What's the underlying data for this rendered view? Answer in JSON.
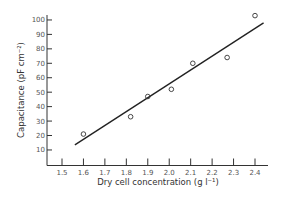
{
  "chart_data": {
    "type": "scatter",
    "title": "",
    "xlabel": "Dry cell concentration (g l⁻¹)",
    "ylabel": "Capacitance (pF cm⁻²)",
    "xlim": [
      1.43,
      2.5
    ],
    "ylim": [
      0,
      105
    ],
    "x_ticks": [
      1.5,
      1.6,
      1.7,
      1.8,
      1.9,
      2.0,
      2.1,
      2.2,
      2.3,
      2.4
    ],
    "x_tick_labels": [
      "1.5",
      "1.6",
      "1.7",
      "1.8",
      "1.9",
      "2.0",
      "2.1",
      "2.2",
      "2.3",
      "2.4"
    ],
    "y_ticks": [
      10,
      20,
      30,
      40,
      50,
      60,
      70,
      80,
      90,
      100
    ],
    "y_tick_labels": [
      "10",
      "20",
      "30",
      "40",
      "50",
      "60",
      "70",
      "80",
      "90",
      "100"
    ],
    "grid": false,
    "legend": null,
    "series": [
      {
        "name": "measured",
        "marker": "open-circle",
        "x": [
          1.6,
          1.82,
          1.9,
          2.01,
          2.11,
          2.27,
          2.4
        ],
        "y": [
          21,
          33,
          47,
          52,
          70,
          74,
          103
        ]
      },
      {
        "name": "fit line",
        "style": "line",
        "x": [
          1.56,
          2.44
        ],
        "y": [
          13.5,
          98
        ]
      }
    ]
  }
}
